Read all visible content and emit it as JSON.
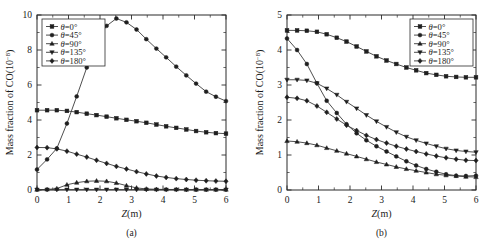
{
  "figure": {
    "panels": [
      {
        "tag": "(a)",
        "xlabel_var": "Z",
        "xlabel_unit": "(m)",
        "ylabel_main": "Mass fraction of CO(10",
        "ylabel_exp": "−8",
        "ylabel_tail": ")",
        "xlim": [
          0,
          6
        ],
        "ylim": [
          0,
          10
        ],
        "xticks": [
          "0",
          "1",
          "2",
          "3",
          "4",
          "5",
          "6"
        ],
        "yticks": [
          "0",
          "2",
          "4",
          "6",
          "8",
          "10"
        ],
        "legend_position": "top-left"
      },
      {
        "tag": "(b)",
        "xlabel_var": "Z",
        "xlabel_unit": "(m)",
        "ylabel_main": "Mass fraction of CO(10",
        "ylabel_exp": "−8",
        "ylabel_tail": ")",
        "xlim": [
          0,
          6
        ],
        "ylim": [
          0,
          5
        ],
        "xticks": [
          "0",
          "1",
          "2",
          "3",
          "4",
          "5",
          "6"
        ],
        "yticks": [
          "0",
          "1",
          "2",
          "3",
          "4",
          "5"
        ],
        "legend_position": "top-right"
      }
    ]
  },
  "chart_data": [
    {
      "type": "line",
      "panel": "(a)",
      "title": "",
      "xlabel": "Z(m)",
      "ylabel": "Mass fraction of CO(10−8)",
      "xlim": [
        0,
        6
      ],
      "ylim": [
        0,
        10
      ],
      "xticks": [
        0,
        1,
        2,
        3,
        4,
        5,
        6
      ],
      "yticks": [
        0,
        2,
        4,
        6,
        8,
        10
      ],
      "grid": false,
      "legend": [
        "θ=0°",
        "θ=45°",
        "θ=90°",
        "θ=135°",
        "θ=180°"
      ],
      "legend_position": "upper left",
      "x": [
        0,
        0.32,
        0.63,
        0.95,
        1.26,
        1.58,
        1.89,
        2.21,
        2.52,
        2.84,
        3.16,
        3.47,
        3.79,
        4.1,
        4.42,
        4.74,
        5.05,
        5.37,
        5.68,
        6.0
      ],
      "series": [
        {
          "name": "θ=0°",
          "marker": "square",
          "values": [
            4.56,
            4.56,
            4.56,
            4.52,
            4.45,
            4.36,
            4.28,
            4.19,
            4.1,
            4.01,
            3.93,
            3.84,
            3.74,
            3.64,
            3.55,
            3.46,
            3.37,
            3.3,
            3.25,
            3.22
          ]
        },
        {
          "name": "θ=45°",
          "marker": "circle",
          "values": [
            1.17,
            1.75,
            2.38,
            3.8,
            5.35,
            7.0,
            8.55,
            9.38,
            9.8,
            9.58,
            9.17,
            8.62,
            8.08,
            7.58,
            7.05,
            6.55,
            6.08,
            5.62,
            5.33,
            5.08
          ]
        },
        {
          "name": "θ=90°",
          "marker": "triangle-up",
          "values": [
            0.02,
            0.03,
            0.08,
            0.3,
            0.42,
            0.5,
            0.52,
            0.5,
            0.4,
            0.25,
            0.12,
            0.06,
            0.04,
            0.03,
            0.03,
            0.02,
            0.02,
            0.02,
            0.02,
            0.02
          ]
        },
        {
          "name": "θ=135°",
          "marker": "triangle-down",
          "values": [
            0.02,
            0.02,
            0.02,
            0.02,
            0.02,
            0.02,
            0.02,
            0.02,
            0.02,
            0.02,
            0.02,
            0.02,
            0.02,
            0.02,
            0.02,
            0.02,
            0.02,
            0.02,
            0.02,
            0.02
          ]
        },
        {
          "name": "θ=180°",
          "marker": "diamond",
          "values": [
            2.43,
            2.42,
            2.35,
            2.22,
            2.05,
            1.88,
            1.7,
            1.52,
            1.35,
            1.2,
            1.05,
            0.92,
            0.8,
            0.72,
            0.65,
            0.6,
            0.56,
            0.53,
            0.51,
            0.5
          ]
        }
      ]
    },
    {
      "type": "line",
      "panel": "(b)",
      "title": "",
      "xlabel": "Z(m)",
      "ylabel": "Mass fraction of CO(10−8)",
      "xlim": [
        0,
        6
      ],
      "ylim": [
        0,
        5
      ],
      "xticks": [
        0,
        1,
        2,
        3,
        4,
        5,
        6
      ],
      "yticks": [
        0,
        1,
        2,
        3,
        4,
        5
      ],
      "grid": false,
      "legend": [
        "θ=0°",
        "θ=45°",
        "θ=90°",
        "θ=135°",
        "θ=180°"
      ],
      "legend_position": "upper right",
      "x": [
        0,
        0.32,
        0.63,
        0.95,
        1.26,
        1.58,
        1.89,
        2.21,
        2.52,
        2.84,
        3.16,
        3.47,
        3.79,
        4.1,
        4.42,
        4.74,
        5.05,
        5.37,
        5.68,
        6.0
      ],
      "series": [
        {
          "name": "θ=0°",
          "marker": "square",
          "values": [
            4.56,
            4.56,
            4.55,
            4.52,
            4.45,
            4.35,
            4.24,
            4.1,
            3.96,
            3.82,
            3.7,
            3.6,
            3.5,
            3.42,
            3.34,
            3.29,
            3.25,
            3.23,
            3.22,
            3.22
          ]
        },
        {
          "name": "θ=45°",
          "marker": "circle",
          "values": [
            4.33,
            4.0,
            3.6,
            3.05,
            2.55,
            2.2,
            1.88,
            1.62,
            1.42,
            1.25,
            1.1,
            0.96,
            0.82,
            0.7,
            0.6,
            0.52,
            0.45,
            0.41,
            0.4,
            0.41
          ]
        },
        {
          "name": "θ=90°",
          "marker": "triangle-up",
          "values": [
            1.4,
            1.38,
            1.34,
            1.28,
            1.2,
            1.12,
            1.04,
            0.96,
            0.88,
            0.8,
            0.73,
            0.66,
            0.6,
            0.55,
            0.5,
            0.45,
            0.42,
            0.4,
            0.38,
            0.37
          ]
        },
        {
          "name": "θ=135°",
          "marker": "triangle-down",
          "values": [
            3.15,
            3.15,
            3.13,
            3.05,
            2.9,
            2.72,
            2.52,
            2.33,
            2.14,
            1.96,
            1.8,
            1.65,
            1.52,
            1.42,
            1.33,
            1.25,
            1.18,
            1.13,
            1.1,
            1.08
          ]
        },
        {
          "name": "θ=180°",
          "marker": "diamond",
          "values": [
            2.65,
            2.62,
            2.55,
            2.4,
            2.22,
            2.03,
            1.85,
            1.7,
            1.56,
            1.44,
            1.34,
            1.25,
            1.17,
            1.1,
            1.03,
            0.97,
            0.92,
            0.88,
            0.85,
            0.84
          ]
        }
      ]
    }
  ]
}
